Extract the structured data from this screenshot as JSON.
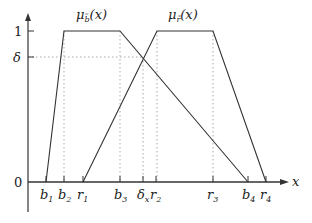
{
  "diagram": {
    "axes": {
      "x_label": "x",
      "y_ticks": [
        {
          "label": "1",
          "y": 31
        },
        {
          "label": "δ",
          "y": 57
        }
      ],
      "origin_label": "0"
    },
    "x_ticks": [
      {
        "id": "b1",
        "base": "b",
        "sub": "1",
        "x": 46
      },
      {
        "id": "b2",
        "base": "b",
        "sub": "2",
        "x": 64
      },
      {
        "id": "r1",
        "base": "r",
        "sub": "1",
        "x": 83
      },
      {
        "id": "b3",
        "base": "b",
        "sub": "3",
        "x": 120
      },
      {
        "id": "dx",
        "base": "δ",
        "sub": "x",
        "x": 143
      },
      {
        "id": "r2",
        "base": "r",
        "sub": "2",
        "x": 156
      },
      {
        "id": "r3",
        "base": "r",
        "sub": "3",
        "x": 213
      },
      {
        "id": "b4",
        "base": "b",
        "sub": "4",
        "x": 248
      },
      {
        "id": "r4",
        "base": "r",
        "sub": "4",
        "x": 266
      }
    ],
    "curves": [
      {
        "name": "mu-b",
        "label_base": "μ",
        "label_sub": "b̃",
        "label_tail": "(x)",
        "points": "46,182 64,31 120,31 248,182",
        "label_x": 76,
        "label_y": 19
      },
      {
        "name": "mu-r",
        "label_base": "μ",
        "label_sub": "r̃",
        "label_tail": "(x)",
        "points": "83,182 157,31 213,31 266,182",
        "label_x": 168,
        "label_y": 19
      }
    ],
    "colors": {
      "line": "#333333",
      "dotted": "#aaaaaa"
    }
  }
}
